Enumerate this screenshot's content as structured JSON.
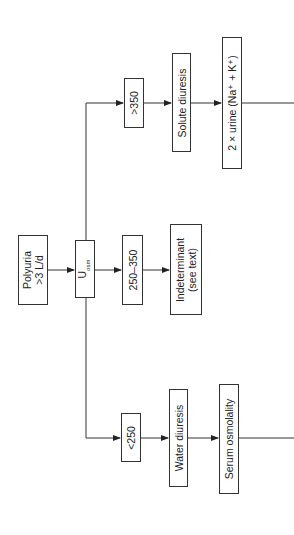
{
  "diagram": {
    "orientation": "rotated-90-ccw",
    "nodes": {
      "polyuria": {
        "line1": "Polyuria",
        "line2": ">3 L/d"
      },
      "uosm": {
        "main": "U",
        "sub": "osm"
      },
      "low": {
        "label": "<250"
      },
      "mid": {
        "label": "250–350"
      },
      "high": {
        "label": ">350"
      },
      "water_diuresis": {
        "label": "Water diuresis"
      },
      "indeterminant": {
        "line1": "Indeterminant",
        "line2": "(see text)"
      },
      "solute_diuresis": {
        "label": "Solute diuresis"
      },
      "serum_osmolality": {
        "label": "Serum osmolality"
      },
      "urine_calc": {
        "label": "2 × urine (Na⁺ + K⁺)"
      }
    },
    "edges": [
      [
        "polyuria",
        "uosm"
      ],
      [
        "uosm",
        "low"
      ],
      [
        "uosm",
        "mid"
      ],
      [
        "uosm",
        "high"
      ],
      [
        "low",
        "water_diuresis"
      ],
      [
        "mid",
        "indeterminant"
      ],
      [
        "high",
        "solute_diuresis"
      ],
      [
        "water_diuresis",
        "serum_osmolality"
      ],
      [
        "solute_diuresis",
        "urine_calc"
      ],
      [
        "serum_osmolality",
        "continues-offscreen"
      ],
      [
        "urine_calc",
        "continues-offscreen"
      ]
    ]
  }
}
